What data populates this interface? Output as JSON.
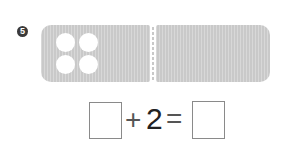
{
  "problem": {
    "number_badge": "5",
    "figure": {
      "left_bar_dots": 4,
      "bar_color": "#c9c9c9",
      "dot_color": "#ffffff"
    },
    "equation": {
      "blank_1": "",
      "plus": "+",
      "addend": "2",
      "equals": "=",
      "blank_2": ""
    }
  }
}
